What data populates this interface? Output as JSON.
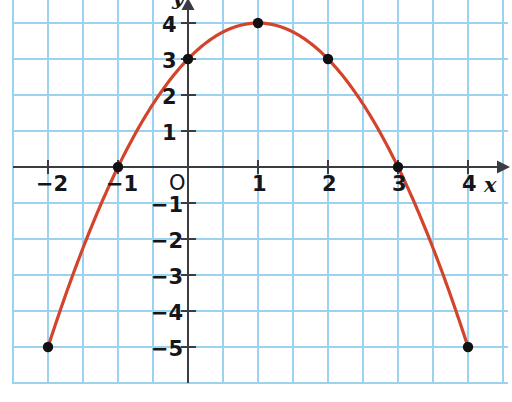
{
  "chart_data": {
    "type": "line",
    "title": "",
    "subtitle": "",
    "xlabel": "x",
    "ylabel": "y",
    "origin_label": "O",
    "xlim": [
      -2.5,
      4.6
    ],
    "ylim": [
      -5.6,
      4.6
    ],
    "xticks": [
      -2,
      -1,
      1,
      2,
      3,
      4
    ],
    "yticks": [
      4,
      3,
      2,
      1,
      -1,
      -2,
      -3,
      -4,
      -5
    ],
    "xtick_labels": [
      "−2",
      "−1",
      "1",
      "2",
      "3",
      "4"
    ],
    "ytick_labels": [
      "4",
      "3",
      "2",
      "1",
      "−1",
      "−2",
      "−3",
      "−4",
      "−5"
    ],
    "grid": true,
    "grid_color": "#9bd2ef",
    "grid_minor_spacing_x": 0.5,
    "grid_minor_spacing_y": 1,
    "axis_color": "#3b3b42",
    "legend": null,
    "legend_position": "none",
    "series": [
      {
        "name": "parabola",
        "equation": "y = -x^2 + 2x + 3",
        "color": "#d4432c",
        "marker": "filled-circle",
        "marker_color": "#111111",
        "x": [
          -2,
          -1,
          0,
          1,
          2,
          3,
          4
        ],
        "values": [
          -5,
          0,
          3,
          4,
          3,
          0,
          -5
        ]
      }
    ],
    "marked_points": [
      {
        "label": "(-2, -5)",
        "x": -2,
        "y": -5
      },
      {
        "label": "(-1, 0)",
        "x": -1,
        "y": 0
      },
      {
        "label": "(0, 3)",
        "x": 0,
        "y": 3
      },
      {
        "label": "(1, 4)",
        "x": 1,
        "y": 4
      },
      {
        "label": "(2, 3)",
        "x": 2,
        "y": 3
      },
      {
        "label": "(3, 0)",
        "x": 3,
        "y": 0
      },
      {
        "label": "(4, -5)",
        "x": 4,
        "y": -5
      }
    ]
  },
  "labels": {
    "x_axis": "x",
    "y_axis": "y",
    "origin": "O",
    "x": {
      "m2": "−2",
      "m1": "−1",
      "p1": "1",
      "p2": "2",
      "p3": "3",
      "p4": "4"
    },
    "y": {
      "p4": "4",
      "p3": "3",
      "p2": "2",
      "p1": "1",
      "m1": "−1",
      "m2": "−2",
      "m3": "−3",
      "m4": "−4",
      "m5": "−5"
    }
  }
}
